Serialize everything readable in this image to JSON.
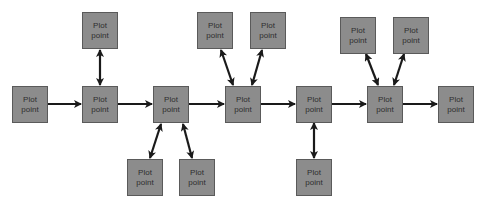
{
  "diagram": {
    "type": "flow",
    "colors": {
      "node_fill": "#8c8c8c",
      "node_border": "#5a5a5a",
      "node_text": "#2e2e2e",
      "arrow": "#1a1a1a",
      "background": "#ffffff"
    },
    "nodes": [
      {
        "id": "n1",
        "label": "Plot\npoint",
        "x": 12,
        "y": 86
      },
      {
        "id": "n2",
        "label": "Plot\npoint",
        "x": 82,
        "y": 86
      },
      {
        "id": "n3",
        "label": "Plot\npoint",
        "x": 153,
        "y": 86
      },
      {
        "id": "n4",
        "label": "Plot\npoint",
        "x": 225,
        "y": 86
      },
      {
        "id": "n5",
        "label": "Plot\npoint",
        "x": 296,
        "y": 86
      },
      {
        "id": "n6",
        "label": "Plot\npoint",
        "x": 367,
        "y": 86
      },
      {
        "id": "n7",
        "label": "Plot\npoint",
        "x": 438,
        "y": 86
      },
      {
        "id": "t2",
        "label": "Plot\npoint",
        "x": 82,
        "y": 12
      },
      {
        "id": "b3a",
        "label": "Plot\npoint",
        "x": 127,
        "y": 159
      },
      {
        "id": "b3b",
        "label": "Plot\npoint",
        "x": 179,
        "y": 159
      },
      {
        "id": "t4a",
        "label": "Plot\npoint",
        "x": 197,
        "y": 12
      },
      {
        "id": "t4b",
        "label": "Plot\npoint",
        "x": 250,
        "y": 12
      },
      {
        "id": "b5",
        "label": "Plot\npoint",
        "x": 296,
        "y": 159
      },
      {
        "id": "t6a",
        "label": "Plot\npoint",
        "x": 340,
        "y": 17
      },
      {
        "id": "t6b",
        "label": "Plot\npoint",
        "x": 393,
        "y": 17
      }
    ],
    "edges": [
      {
        "from": "n1",
        "to": "n2",
        "kind": "one-way"
      },
      {
        "from": "n2",
        "to": "n3",
        "kind": "one-way"
      },
      {
        "from": "n3",
        "to": "n4",
        "kind": "one-way"
      },
      {
        "from": "n4",
        "to": "n5",
        "kind": "one-way"
      },
      {
        "from": "n5",
        "to": "n6",
        "kind": "one-way"
      },
      {
        "from": "n6",
        "to": "n7",
        "kind": "one-way"
      },
      {
        "from": "n2",
        "to": "t2",
        "kind": "two-way"
      },
      {
        "from": "n3",
        "to": "b3a",
        "kind": "two-way"
      },
      {
        "from": "n3",
        "to": "b3b",
        "kind": "two-way"
      },
      {
        "from": "n4",
        "to": "t4a",
        "kind": "two-way"
      },
      {
        "from": "n4",
        "to": "t4b",
        "kind": "two-way"
      },
      {
        "from": "n5",
        "to": "b5",
        "kind": "two-way"
      },
      {
        "from": "n6",
        "to": "t6a",
        "kind": "two-way"
      },
      {
        "from": "n6",
        "to": "t6b",
        "kind": "two-way"
      }
    ],
    "arrow_lines": [
      {
        "x1": 47,
        "y1": 104,
        "x2": 81,
        "y2": 104,
        "start": false,
        "end": true
      },
      {
        "x1": 118,
        "y1": 104,
        "x2": 152,
        "y2": 104,
        "start": false,
        "end": true
      },
      {
        "x1": 189,
        "y1": 104,
        "x2": 224,
        "y2": 104,
        "start": false,
        "end": true
      },
      {
        "x1": 261,
        "y1": 104,
        "x2": 295,
        "y2": 104,
        "start": false,
        "end": true
      },
      {
        "x1": 332,
        "y1": 104,
        "x2": 366,
        "y2": 104,
        "start": false,
        "end": true
      },
      {
        "x1": 403,
        "y1": 104,
        "x2": 437,
        "y2": 104,
        "start": false,
        "end": true
      },
      {
        "x1": 100,
        "y1": 50,
        "x2": 100,
        "y2": 85,
        "start": true,
        "end": true
      },
      {
        "x1": 161,
        "y1": 124,
        "x2": 150,
        "y2": 158,
        "start": true,
        "end": true
      },
      {
        "x1": 183,
        "y1": 124,
        "x2": 192,
        "y2": 158,
        "start": true,
        "end": true
      },
      {
        "x1": 221,
        "y1": 50,
        "x2": 233,
        "y2": 85,
        "start": true,
        "end": true
      },
      {
        "x1": 262,
        "y1": 50,
        "x2": 252,
        "y2": 85,
        "start": true,
        "end": true
      },
      {
        "x1": 314,
        "y1": 123,
        "x2": 314,
        "y2": 158,
        "start": true,
        "end": true
      },
      {
        "x1": 366,
        "y1": 54,
        "x2": 378,
        "y2": 85,
        "start": true,
        "end": true
      },
      {
        "x1": 404,
        "y1": 54,
        "x2": 394,
        "y2": 85,
        "start": true,
        "end": true
      }
    ]
  }
}
